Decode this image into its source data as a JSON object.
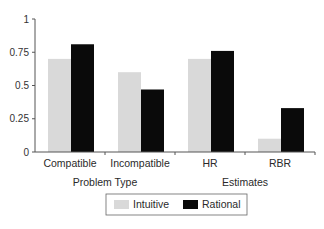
{
  "chart_data": {
    "type": "bar",
    "title": "",
    "xlabel": "",
    "ylabel": "",
    "ylim": [
      0,
      1
    ],
    "yticks": [
      "0",
      "0.25",
      "0.5",
      "0.75",
      "1"
    ],
    "grid": false,
    "categories": [
      "Compatible",
      "Incompatible",
      "HR",
      "RBR"
    ],
    "category_groups": [
      {
        "label": "Problem Type",
        "categories": [
          "Compatible",
          "Incompatible"
        ]
      },
      {
        "label": "Estimates",
        "categories": [
          "HR",
          "RBR"
        ]
      }
    ],
    "series": [
      {
        "name": "Intuitive",
        "color": "#d9d9d9",
        "values": [
          0.7,
          0.6,
          0.7,
          0.1
        ]
      },
      {
        "name": "Rational",
        "color": "#0a0a0a",
        "values": [
          0.81,
          0.47,
          0.76,
          0.33
        ]
      }
    ],
    "legend_position": "bottom"
  }
}
